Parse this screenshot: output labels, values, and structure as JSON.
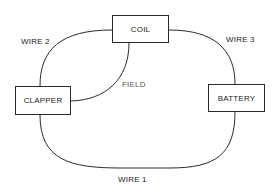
{
  "diagram": {
    "components": [
      {
        "id": "coil",
        "label": "COIL"
      },
      {
        "id": "clapper",
        "label": "CLAPPER"
      },
      {
        "id": "battery",
        "label": "BATTERY"
      }
    ],
    "wires": [
      {
        "id": "wire1",
        "label": "WIRE 1",
        "from": "clapper",
        "to": "battery"
      },
      {
        "id": "wire2",
        "label": "WIRE 2",
        "from": "clapper",
        "to": "coil"
      },
      {
        "id": "wire3",
        "label": "WIRE 3",
        "from": "coil",
        "to": "battery"
      },
      {
        "id": "field",
        "label": "FIELD",
        "from": "coil",
        "to": "clapper"
      }
    ],
    "colors": {
      "line": "#2a2a2a",
      "background": "#ffffff"
    }
  }
}
